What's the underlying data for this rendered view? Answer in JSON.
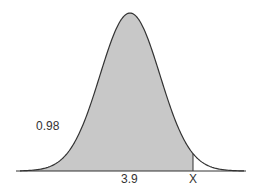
{
  "chart_data": {
    "type": "area",
    "title": "",
    "xlabel": "",
    "ylabel": "",
    "mean_label": "3.9",
    "cutoff_label": "X",
    "shaded_area_label": "0.98",
    "shaded_region": "left of X",
    "grid": false,
    "legend": "none",
    "colors": {
      "fill": "#c8c8c8",
      "curve": "#333333",
      "axis": "#333333"
    }
  },
  "labels": {
    "area": "0.98",
    "mean": "3.9",
    "cutoff": "X"
  }
}
